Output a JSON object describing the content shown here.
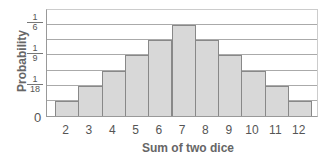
{
  "chart_data": {
    "type": "bar",
    "title": "",
    "xlabel": "Sum of two dice",
    "ylabel": "Probability",
    "categories": [
      "2",
      "3",
      "4",
      "5",
      "6",
      "7",
      "8",
      "9",
      "10",
      "11",
      "12"
    ],
    "values": [
      0.0278,
      0.0556,
      0.0833,
      0.1111,
      0.1389,
      0.1667,
      0.1389,
      0.1111,
      0.0833,
      0.0556,
      0.0278
    ],
    "values_fraction": [
      "1/36",
      "2/36",
      "3/36",
      "4/36",
      "5/36",
      "6/36",
      "5/36",
      "4/36",
      "3/36",
      "2/36",
      "1/36"
    ],
    "ylim": [
      0,
      0.1944
    ],
    "y_tick_labels": [
      {
        "label": "0",
        "value": 0
      },
      {
        "num": "1",
        "den": "18",
        "value": 0.0556
      },
      {
        "num": "1",
        "den": "9",
        "value": 0.1111
      },
      {
        "num": "1",
        "den": "6",
        "value": 0.1667
      }
    ],
    "grid": true,
    "gridline_step": 0.0278
  },
  "axes": {
    "zero": "0",
    "ylabel": "Probability",
    "xlabel": "Sum of two dice",
    "frac18": {
      "num": "1",
      "den": "18"
    },
    "frac9": {
      "num": "1",
      "den": "9"
    },
    "frac6": {
      "num": "1",
      "den": "6"
    }
  }
}
